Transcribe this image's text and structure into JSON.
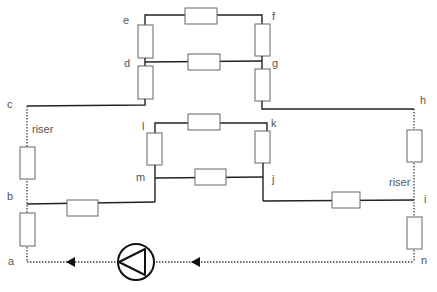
{
  "diagram": {
    "type": "heating-pipe-network schematic",
    "nodes": {
      "a": "a",
      "b": "b",
      "c": "c",
      "d": "d",
      "e": "e",
      "f": "f",
      "g": "g",
      "h": "h",
      "i": "i",
      "j": "j",
      "k": "k",
      "l": "l",
      "m": "m",
      "n": "n"
    },
    "labels": {
      "riser_left": "riser",
      "riser_right": "riser"
    },
    "components": {
      "pump": "pump",
      "flow_arrows": 2,
      "resistors": 16
    },
    "colors": {
      "pipe": "#222222",
      "resistor_border": "#666666",
      "label": "#555555",
      "background": "#ffffff"
    }
  }
}
